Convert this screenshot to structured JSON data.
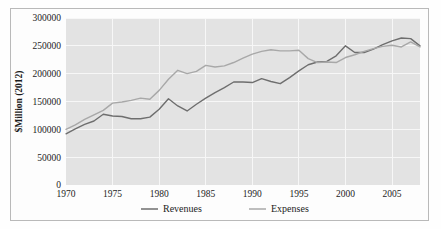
{
  "chart_data": {
    "type": "line",
    "title": "",
    "xlabel": "",
    "ylabel": "$Million (2012)",
    "xlim": [
      1970,
      2008
    ],
    "ylim": [
      0,
      300000
    ],
    "grid": true,
    "legend_position": "bottom",
    "x_ticks": [
      "1970",
      "1975",
      "1980",
      "1985",
      "1990",
      "1995",
      "2000",
      "2005"
    ],
    "x_tick_values": [
      1970,
      1975,
      1980,
      1985,
      1990,
      1995,
      2000,
      2005
    ],
    "y_ticks": [
      "0",
      "50000",
      "100000",
      "150000",
      "200000",
      "250000",
      "300000"
    ],
    "y_tick_values": [
      0,
      50000,
      100000,
      150000,
      200000,
      250000,
      300000
    ],
    "x": [
      1970,
      1971,
      1972,
      1973,
      1974,
      1975,
      1976,
      1977,
      1978,
      1979,
      1980,
      1981,
      1982,
      1983,
      1984,
      1985,
      1986,
      1987,
      1988,
      1989,
      1990,
      1991,
      1992,
      1993,
      1994,
      1995,
      1996,
      1997,
      1998,
      1999,
      2000,
      2001,
      2002,
      2003,
      2004,
      2005,
      2006,
      2007,
      2008
    ],
    "series": [
      {
        "name": "Revenues",
        "color": "#6e6e6e",
        "values": [
          92000,
          101000,
          109000,
          115000,
          127000,
          124000,
          123000,
          119000,
          119000,
          122000,
          136000,
          155000,
          142000,
          133000,
          145000,
          156000,
          166000,
          175000,
          185000,
          185000,
          184000,
          191000,
          186000,
          182000,
          193000,
          205000,
          216000,
          221000,
          222000,
          232000,
          250000,
          238000,
          238000,
          244000,
          252000,
          259000,
          264000,
          263000,
          250000
        ]
      },
      {
        "name": "Expenses",
        "color": "#a8a8a8",
        "values": [
          100000,
          108000,
          118000,
          126000,
          134000,
          147000,
          149000,
          152000,
          156000,
          154000,
          170000,
          190000,
          206000,
          200000,
          204000,
          215000,
          212000,
          214000,
          220000,
          228000,
          235000,
          240000,
          243000,
          241000,
          241000,
          242000,
          227000,
          220000,
          221000,
          220000,
          229000,
          234000,
          240000,
          245000,
          249000,
          251000,
          248000,
          257000,
          248000
        ]
      }
    ],
    "legend": [
      {
        "label": "Revenues",
        "color": "#6e6e6e"
      },
      {
        "label": "Expenses",
        "color": "#a8a8a8"
      }
    ]
  },
  "layout": {
    "plot": {
      "left": 66,
      "top": 18,
      "right": 420,
      "bottom": 185
    }
  }
}
